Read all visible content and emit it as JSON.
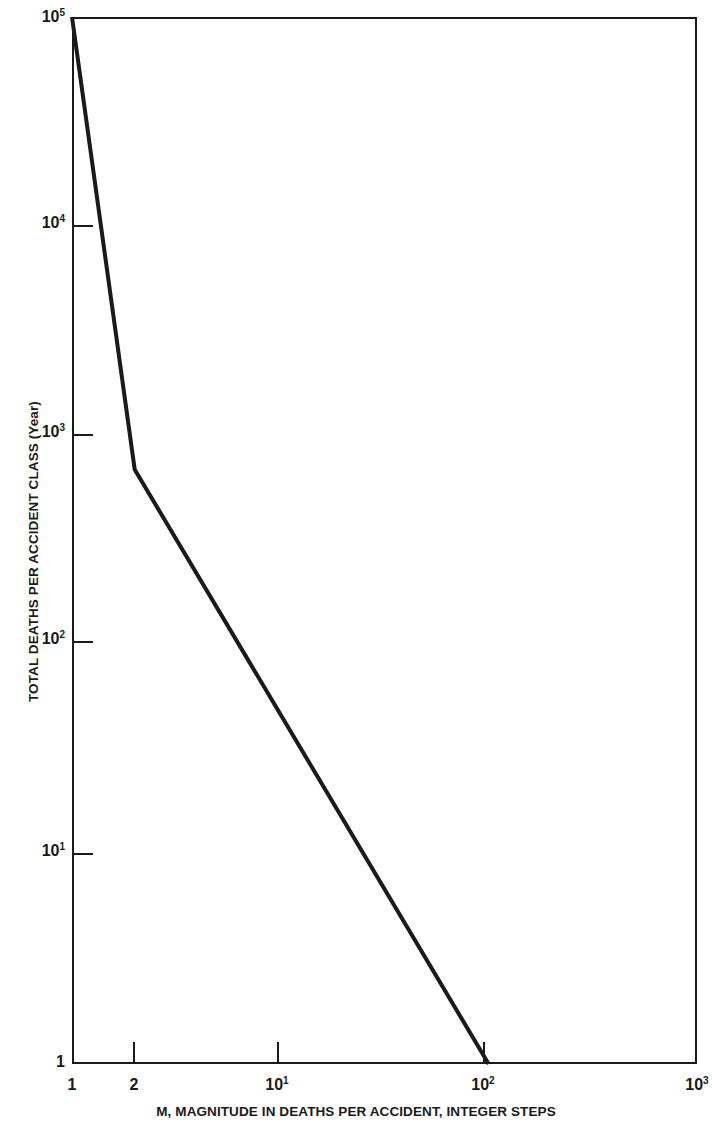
{
  "figure": {
    "background_color": "#ffffff",
    "line_color": "#1a1a1a",
    "axis_color": "#1a1a1a"
  },
  "axes": {
    "x_title": "M, MAGNITUDE IN DEATHS PER ACCIDENT, INTEGER STEPS",
    "y_title": "TOTAL DEATHS PER ACCIDENT CLASS (Year)",
    "x_ticks": [
      {
        "label_base": "1",
        "label_exp": "",
        "value": 1
      },
      {
        "label_base": "2",
        "label_exp": "",
        "value": 2
      },
      {
        "label_base": "10",
        "label_exp": "1",
        "value": 10
      },
      {
        "label_base": "10",
        "label_exp": "2",
        "value": 100
      },
      {
        "label_base": "10",
        "label_exp": "3",
        "value": 1000
      }
    ],
    "y_ticks": [
      {
        "label_base": "10",
        "label_exp": "5",
        "value": 100000
      },
      {
        "label_base": "10",
        "label_exp": "4",
        "value": 10000
      },
      {
        "label_base": "10",
        "label_exp": "3",
        "value": 1000
      },
      {
        "label_base": "10",
        "label_exp": "2",
        "value": 100
      },
      {
        "label_base": "10",
        "label_exp": "1",
        "value": 10
      },
      {
        "label_base": "1",
        "label_exp": "",
        "value": 1
      }
    ]
  },
  "chart_data": {
    "type": "line",
    "title": "",
    "subtitle": "",
    "xlabel": "M, MAGNITUDE IN DEATHS PER ACCIDENT, INTEGER STEPS",
    "ylabel": "TOTAL DEATHS PER ACCIDENT CLASS (Year)",
    "xscale": "log",
    "yscale": "log",
    "xlim": [
      1,
      1000
    ],
    "ylim": [
      1,
      100000
    ],
    "grid": false,
    "legend": null,
    "x_tick_labels": [
      "1",
      "2",
      "10^1",
      "10^2",
      "10^3"
    ],
    "y_tick_labels": [
      "1",
      "10^1",
      "10^2",
      "10^3",
      "10^4",
      "10^5"
    ],
    "series": [
      {
        "name": "Total deaths per accident class",
        "x": [
          1,
          2,
          100
        ],
        "y": [
          100000,
          690,
          1
        ],
        "line_width_px": 4,
        "color": "#1a1a1a",
        "markers": false
      }
    ],
    "annotations": []
  }
}
